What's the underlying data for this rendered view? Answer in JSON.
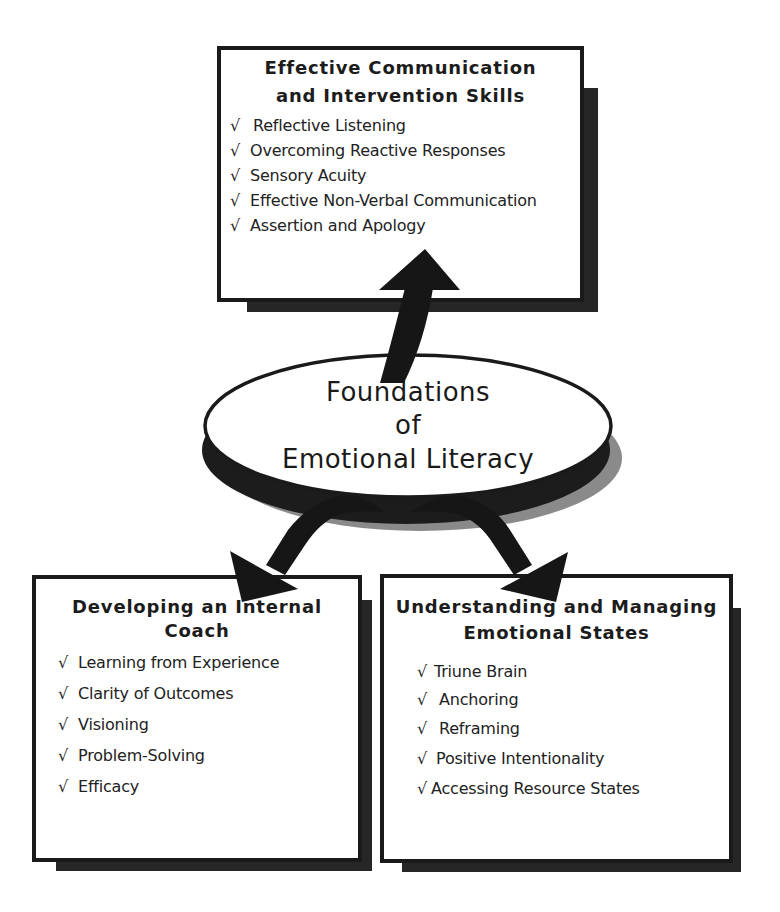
{
  "center": {
    "lines": [
      "Foundations",
      "of",
      "Emotional Literacy"
    ]
  },
  "top_box": {
    "title_lines": [
      "Effective Communication",
      "and Intervention Skills"
    ],
    "items": [
      "Reflective Listening",
      "Overcoming Reactive Responses",
      "Sensory Acuity",
      "Effective Non-Verbal Communication",
      "Assertion and Apology"
    ]
  },
  "left_box": {
    "title_lines": [
      "Developing an Internal",
      "Coach"
    ],
    "items": [
      "Learning from Experience",
      "Clarity of Outcomes",
      "Visioning",
      "Problem-Solving",
      "Efficacy"
    ]
  },
  "right_box": {
    "title_lines": [
      "Understanding and Managing",
      "Emotional States"
    ],
    "items": [
      "Triune Brain",
      "Anchoring",
      "Reframing",
      "Positive Intentionality",
      "Accessing Resource States"
    ]
  },
  "check_glyph": "√",
  "colors": {
    "ink": "#1a1a1a",
    "shadow_dark": "#262626",
    "shadow_gray": "#8a8a8a",
    "background": "#ffffff"
  }
}
